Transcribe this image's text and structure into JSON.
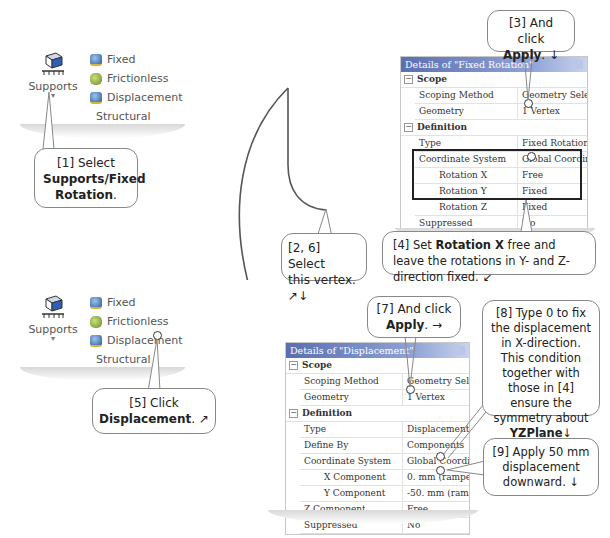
{
  "ribbon_top": {
    "supports_label": "Supports",
    "supports_dropdown": "▾",
    "items": [
      {
        "label": "Fixed",
        "icon": "fixed-support-icon"
      },
      {
        "label": "Frictionless",
        "icon": "frictionless-support-icon"
      },
      {
        "label": "Displacement",
        "icon": "displacement-icon"
      }
    ],
    "group_label": "Structural"
  },
  "ribbon_bottom": {
    "supports_label": "Supports",
    "supports_dropdown": "▾",
    "items": [
      {
        "label": "Fixed",
        "icon": "fixed-support-icon"
      },
      {
        "label": "Frictionless",
        "icon": "frictionless-support-icon"
      },
      {
        "label": "Displacement",
        "icon": "displacement-icon"
      }
    ],
    "group_label": "Structural"
  },
  "callouts": {
    "c1": {
      "prefix": "[1] Select",
      "bold": "Supports/Fixed Rotation",
      "suffix": "."
    },
    "c2": {
      "line1": "[2, 6] Select",
      "line2": "this vertex. ↗↓"
    },
    "c3": {
      "line1": "[3] And click",
      "bold": "Apply",
      "suffix": ". ↓"
    },
    "c4": {
      "prefix": "[4] Set ",
      "bold": "Rotation X",
      "suffix": " free and leave the rotations in Y- and Z-direction fixed. ↙"
    },
    "c5": {
      "line1": "[5] Click",
      "bold": "Displacement",
      "suffix": ". ↗"
    },
    "c7": {
      "line1": "[7] And click",
      "bold": "Apply",
      "suffix": ". →"
    },
    "c8": {
      "text": "[8] Type 0 to fix the displacement in X-direction. This condition together with those in [4] ensure the symmetry about",
      "bold": "YZPlane",
      "suffix": "↓"
    },
    "c9": {
      "text": "[9] Apply 50 mm displacement downward. ↓"
    }
  },
  "panel_fixed_rotation": {
    "title": "Details of \"Fixed Rotation\"",
    "groups": [
      {
        "name": "Scope",
        "toggle": "−",
        "rows": [
          {
            "label": "Scoping Method",
            "value": "Geometry Selection"
          },
          {
            "label": "Geometry",
            "value": "1 Vertex"
          }
        ]
      },
      {
        "name": "Definition",
        "toggle": "−",
        "rows": [
          {
            "label": "Type",
            "value": "Fixed Rotation"
          },
          {
            "label": "Coordinate System",
            "value": "Global Coordinate System"
          },
          {
            "label": "Rotation X",
            "value": "Free"
          },
          {
            "label": "Rotation Y",
            "value": "Fixed"
          },
          {
            "label": "Rotation Z",
            "value": "Fixed"
          },
          {
            "label": "Suppressed",
            "value": "No"
          }
        ]
      }
    ]
  },
  "panel_displacement": {
    "title": "Details of \"Displacement\"",
    "groups": [
      {
        "name": "Scope",
        "toggle": "−",
        "rows": [
          {
            "label": "Scoping Method",
            "value": "Geometry Selection"
          },
          {
            "label": "Geometry",
            "value": "1 Vertex"
          }
        ]
      },
      {
        "name": "Definition",
        "toggle": "−",
        "rows": [
          {
            "label": "Type",
            "value": "Displacement"
          },
          {
            "label": "Define By",
            "value": "Components"
          },
          {
            "label": "Coordinate System",
            "value": "Global Coordinate System"
          },
          {
            "label": "X Component",
            "value": "0. mm  (ramped)"
          },
          {
            "label": "Y Component",
            "value": "-50. mm  (ramped)"
          },
          {
            "label": "Z Component",
            "value": "Free"
          },
          {
            "label": "Suppressed",
            "value": "No"
          }
        ]
      }
    ]
  },
  "colors": {
    "panel_title_start": "#5a6fb0",
    "panel_title_end": "#c9d3ee",
    "callout_border": "#888888",
    "geometry_stroke": "#555555"
  }
}
